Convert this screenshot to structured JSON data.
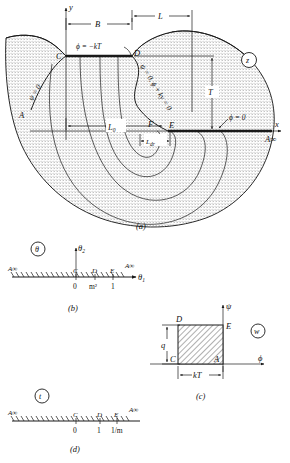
{
  "figure": {
    "title_visible": false,
    "panels": [
      {
        "id": "a",
        "caption": "(a)",
        "plane_label": "z"
      },
      {
        "id": "b",
        "caption": "(b)",
        "plane_label": "θ"
      },
      {
        "id": "c",
        "caption": "(c)",
        "plane_label": "w"
      },
      {
        "id": "d",
        "caption": "(d)",
        "plane_label": "t"
      }
    ]
  },
  "panel_a": {
    "axes": {
      "x_label": "x",
      "y_label": "y"
    },
    "points": [
      {
        "name": "A",
        "label": "A"
      },
      {
        "name": "C",
        "label": "C"
      },
      {
        "name": "D",
        "label": "D"
      },
      {
        "name": "E",
        "label": "E"
      },
      {
        "name": "F",
        "label": "F"
      },
      {
        "name": "A_infinity",
        "label": "A∞"
      }
    ],
    "dimensions": [
      {
        "name": "B",
        "label": "B"
      },
      {
        "name": "L",
        "label": "L"
      },
      {
        "name": "T",
        "label": "T"
      },
      {
        "name": "L0",
        "label": "L",
        "sub": "0"
      },
      {
        "name": "Ldr",
        "label": "L",
        "sub": "dr"
      }
    ],
    "boundary_conditions": [
      {
        "name": "phi-top",
        "label": "ϕ = −kT"
      },
      {
        "name": "psi-left",
        "label": "ψ = 0"
      },
      {
        "name": "free-surface",
        "label": "ψ = 0, ϕ + ky = 0"
      },
      {
        "name": "phi-right",
        "label": "ϕ = 0"
      }
    ]
  },
  "panel_b": {
    "axes": {
      "x_label": "θ",
      "x_sub": "1",
      "y_label": "θ",
      "y_sub": "2"
    },
    "end_labels": [
      "A∞",
      "A∞"
    ],
    "point_labels": [
      "C",
      "D",
      "E"
    ],
    "tick_labels": [
      "0",
      "m²",
      "1"
    ]
  },
  "panel_c": {
    "axes": {
      "x_label": "ϕ",
      "y_label": "ψ"
    },
    "corner_labels": {
      "top_left": "D",
      "top_right": "E",
      "bottom_left": "C",
      "bottom_right": "A"
    },
    "dimensions": [
      {
        "name": "q",
        "label": "q"
      },
      {
        "name": "kT",
        "label": "kT"
      }
    ]
  },
  "panel_d": {
    "end_labels": [
      "A∞",
      "A∞"
    ],
    "point_labels": [
      "C",
      "D",
      "E"
    ],
    "tick_labels": [
      "0",
      "1",
      "1/m"
    ]
  }
}
